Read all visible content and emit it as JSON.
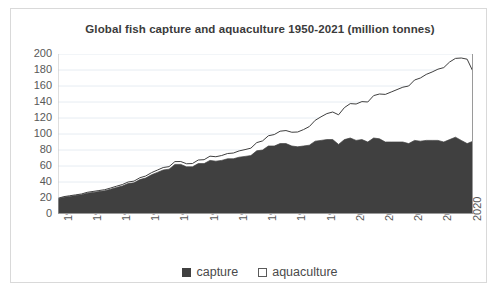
{
  "chart_data": {
    "type": "area",
    "stacked": true,
    "title": "Global fish capture and aquaculture 1950-2021 (million tonnes)",
    "xlabel": "",
    "ylabel": "",
    "ylim": [
      0,
      200
    ],
    "ytick_step": 20,
    "yticks": [
      200,
      180,
      160,
      140,
      120,
      100,
      80,
      60,
      40,
      20,
      0
    ],
    "xlim": [
      1950,
      2021
    ],
    "xtick_labels": [
      "1950",
      "1955",
      "1960",
      "1965",
      "1970",
      "1975",
      "1980",
      "1985",
      "1990",
      "1995",
      "2000",
      "2005",
      "2010",
      "2015",
      "2020"
    ],
    "xtick_step": 5,
    "minor_xticks_every_year": true,
    "grid": "horizontal",
    "legend_position": "bottom",
    "colors": {
      "capture": "#404040",
      "aquaculture": "#ffffff",
      "outline": "#3f3f3f",
      "gridline": "#e6ecf2",
      "axis_text": "#585858",
      "title_text": "#3b3b3b",
      "border": "#d9d9d9"
    },
    "x": [
      1950,
      1951,
      1952,
      1953,
      1954,
      1955,
      1956,
      1957,
      1958,
      1959,
      1960,
      1961,
      1962,
      1963,
      1964,
      1965,
      1966,
      1967,
      1968,
      1969,
      1970,
      1971,
      1972,
      1973,
      1974,
      1975,
      1976,
      1977,
      1978,
      1979,
      1980,
      1981,
      1982,
      1983,
      1984,
      1985,
      1986,
      1987,
      1988,
      1989,
      1990,
      1991,
      1992,
      1993,
      1994,
      1995,
      1996,
      1997,
      1998,
      1999,
      2000,
      2001,
      2002,
      2003,
      2004,
      2005,
      2006,
      2007,
      2008,
      2009,
      2010,
      2011,
      2012,
      2013,
      2014,
      2015,
      2016,
      2017,
      2018,
      2019,
      2020,
      2021
    ],
    "series": [
      {
        "name": "capture",
        "values": [
          19,
          21,
          22,
          23,
          24,
          26,
          27,
          28,
          29,
          31,
          33,
          35,
          38,
          39,
          43,
          45,
          49,
          52,
          55,
          56,
          62,
          62,
          59,
          59,
          63,
          63,
          67,
          66,
          67,
          69,
          69,
          71,
          72,
          73,
          79,
          80,
          85,
          85,
          88,
          88,
          85,
          84,
          85,
          86,
          91,
          92,
          93,
          93,
          87,
          93,
          95,
          92,
          93,
          90,
          95,
          94,
          90,
          90,
          90,
          90,
          88,
          92,
          91,
          92,
          92,
          92,
          90,
          93,
          96,
          92,
          88,
          91
        ]
      },
      {
        "name": "aquaculture",
        "values": [
          0.6,
          0.7,
          0.8,
          0.9,
          1.0,
          1.1,
          1.2,
          1.3,
          1.4,
          1.5,
          1.7,
          1.8,
          2.0,
          2.1,
          2.3,
          2.5,
          2.7,
          2.9,
          3.1,
          3.2,
          3.5,
          3.6,
          3.8,
          4.1,
          4.5,
          4.9,
          5.3,
          5.6,
          6.1,
          6.6,
          7.2,
          7.9,
          8.5,
          9.3,
          10.2,
          11.4,
          12.8,
          14.3,
          15.5,
          16.3,
          17.2,
          18.5,
          20.5,
          23.3,
          26.1,
          29.5,
          32.5,
          34.5,
          37.0,
          40.0,
          43.0,
          45.5,
          47.5,
          50.0,
          53.0,
          56.0,
          59.5,
          62.5,
          65.5,
          68.5,
          72.0,
          75.5,
          79.0,
          82.5,
          85.5,
          89.0,
          93.0,
          97.0,
          98.5,
          103.0,
          105.5,
          87.0
        ]
      }
    ],
    "peak_total": 178,
    "peak_year": 2018
  },
  "legend": {
    "items": [
      {
        "label": "capture",
        "swatch": "filled-square",
        "swatch_name": "capture-swatch"
      },
      {
        "label": "aquaculture",
        "swatch": "outlined-square",
        "swatch_name": "aquaculture-swatch"
      }
    ]
  }
}
